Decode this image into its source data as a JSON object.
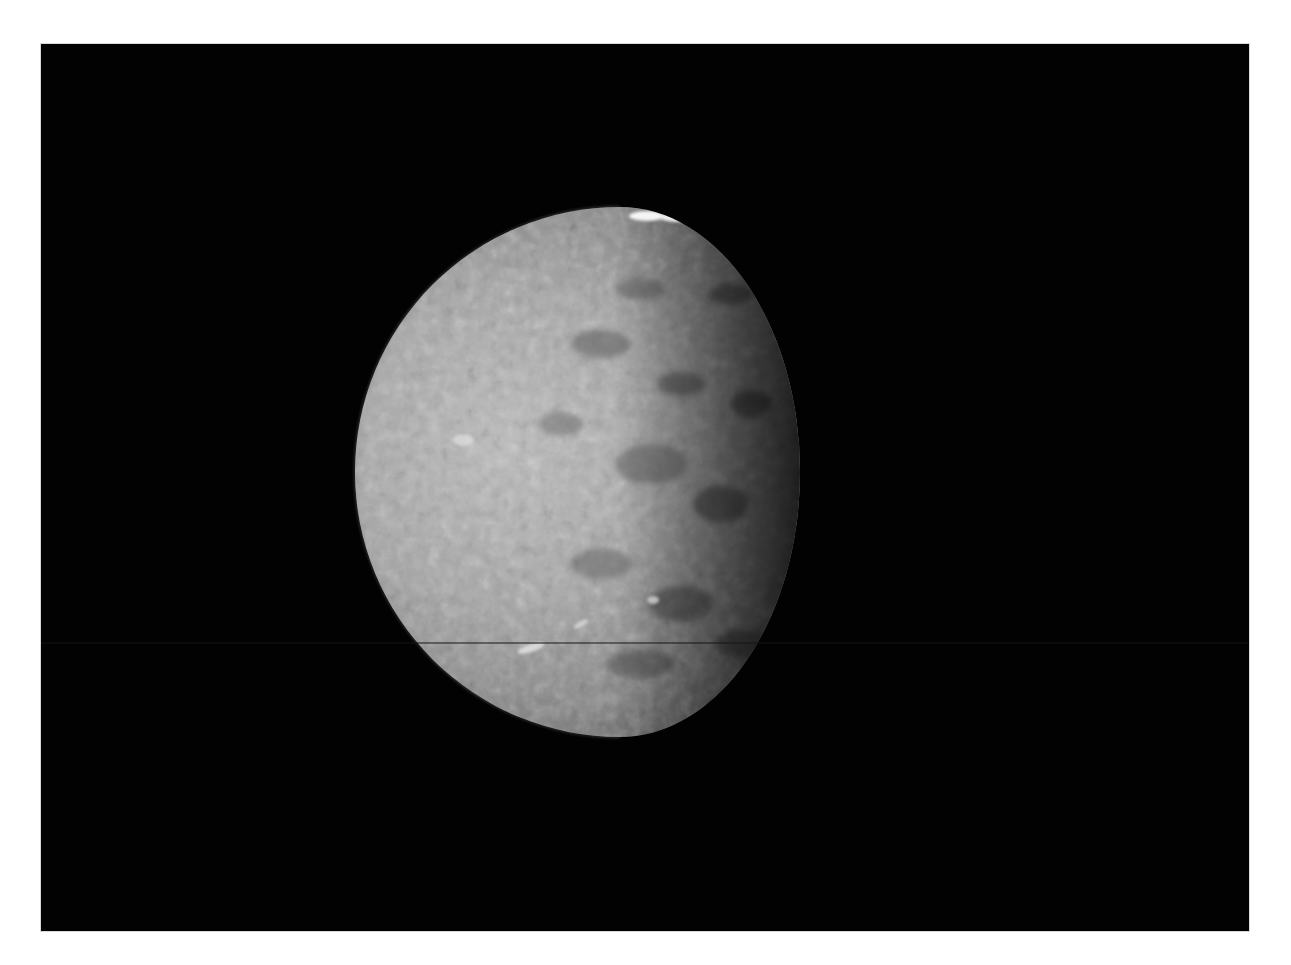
{
  "image": {
    "subject": "Cratered icy moon, gibbous phase, against black space",
    "alt_text": "Grayscale spacecraft image of a heavily cratered moon lit from the left, with a bright crater near the top limb and dark terminator on the right",
    "colors": {
      "border": "#ffffff",
      "space": "#020202",
      "surface_light": "#b8b8b8",
      "surface_mid": "#7a7a7a",
      "surface_dark": "#2a2a2a",
      "highlight": "#f4f4f4"
    },
    "features": [
      {
        "name": "bright-crater-top",
        "x": 665,
        "y": 215
      },
      {
        "name": "bright-spot-upper-right",
        "x": 763,
        "y": 295
      },
      {
        "name": "bright-patch-left",
        "x": 463,
        "y": 440
      },
      {
        "name": "bright-streak-lower-left",
        "x": 530,
        "y": 648
      },
      {
        "name": "scan-line",
        "y": 643
      }
    ]
  }
}
